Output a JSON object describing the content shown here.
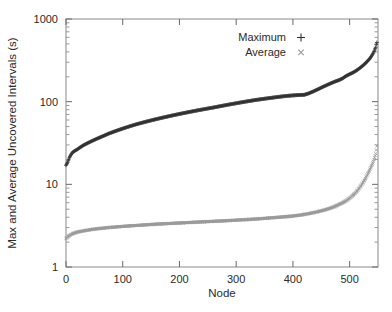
{
  "chart_data": {
    "type": "scatter",
    "title": "",
    "xlabel": "Node",
    "ylabel": "Max and Average Uncovered Intervals (s)",
    "xlim": [
      0,
      550
    ],
    "ylim": [
      1,
      1000
    ],
    "yscale": "log",
    "xscale": "linear",
    "grid": false,
    "legend_position": "top-center-right",
    "xticks": [
      "0",
      "100",
      "200",
      "300",
      "400",
      "500"
    ],
    "xtick_values": [
      0,
      100,
      200,
      300,
      400,
      500
    ],
    "yticks": [
      "1",
      "10",
      "100",
      "1000"
    ],
    "ytick_values": [
      1,
      10,
      100,
      1000
    ],
    "series": [
      {
        "name": "Maximum",
        "marker": "+",
        "color": "#333333",
        "x": [
          0,
          3,
          6,
          9,
          12,
          16,
          20,
          25,
          30,
          36,
          42,
          50,
          58,
          66,
          75,
          85,
          95,
          105,
          115,
          125,
          140,
          155,
          170,
          185,
          200,
          215,
          230,
          245,
          260,
          275,
          290,
          305,
          320,
          335,
          350,
          365,
          378,
          390,
          400,
          408,
          414,
          420,
          428,
          436,
          444,
          452,
          460,
          468,
          475,
          482,
          488,
          494,
          500,
          506,
          512,
          518,
          523,
          528,
          532,
          536,
          539,
          542,
          544,
          546,
          547,
          548
        ],
        "y": [
          17.0,
          18.5,
          21.0,
          23.0,
          24.5,
          25.5,
          26.5,
          28.0,
          29.5,
          31.0,
          32.5,
          34.5,
          36.5,
          38.5,
          41.0,
          43.5,
          46.0,
          48.5,
          51.0,
          53.5,
          57.0,
          60.5,
          64.0,
          67.5,
          71.0,
          74.5,
          78.0,
          81.5,
          85.0,
          89.0,
          93.0,
          97.0,
          101.0,
          105.0,
          108.5,
          112.0,
          115.0,
          117.5,
          119.0,
          120.0,
          120.5,
          121.0,
          126.0,
          133.0,
          141.0,
          150.0,
          159.0,
          168.0,
          176.0,
          183.0,
          192.0,
          205.0,
          215.0,
          225.0,
          238.0,
          255.0,
          272.0,
          292.0,
          312.0,
          335.0,
          360.0,
          390.0,
          420.0,
          455.0,
          490.0,
          520.0
        ]
      },
      {
        "name": "Average",
        "marker": "x",
        "color": "#9a9a9a",
        "x": [
          0,
          4,
          8,
          13,
          18,
          24,
          30,
          38,
          46,
          55,
          65,
          75,
          88,
          100,
          115,
          130,
          145,
          160,
          175,
          190,
          205,
          220,
          235,
          250,
          265,
          280,
          295,
          310,
          325,
          340,
          355,
          370,
          385,
          398,
          410,
          420,
          430,
          440,
          450,
          458,
          466,
          474,
          481,
          488,
          494,
          500,
          506,
          511,
          516,
          520,
          524,
          528,
          531,
          534,
          537,
          540,
          542,
          544,
          546,
          547,
          548
        ],
        "y": [
          2.2,
          2.35,
          2.45,
          2.55,
          2.62,
          2.68,
          2.73,
          2.79,
          2.85,
          2.9,
          2.95,
          3.0,
          3.05,
          3.1,
          3.15,
          3.2,
          3.25,
          3.3,
          3.34,
          3.38,
          3.42,
          3.46,
          3.5,
          3.54,
          3.58,
          3.62,
          3.67,
          3.72,
          3.77,
          3.83,
          3.9,
          3.97,
          4.05,
          4.12,
          4.22,
          4.32,
          4.45,
          4.6,
          4.78,
          4.95,
          5.15,
          5.4,
          5.7,
          6.0,
          6.35,
          6.8,
          7.4,
          8.0,
          8.8,
          9.6,
          10.6,
          11.8,
          13.0,
          14.3,
          15.8,
          17.5,
          19.0,
          21.0,
          23.5,
          26.0,
          29.0
        ]
      }
    ]
  },
  "legend": {
    "entries": [
      {
        "label": "Maximum",
        "marker": "plus-marker"
      },
      {
        "label": "Average",
        "marker": "cross-marker"
      }
    ]
  },
  "axes": {
    "x_title": "Node",
    "y_title": "Max and Average Uncovered Intervals (s)"
  },
  "colors": {
    "maximum": "#333333",
    "average": "#9a9a9a",
    "axis": "#8a8a8a",
    "text": "#2a2a2a",
    "background": "#ffffff"
  }
}
